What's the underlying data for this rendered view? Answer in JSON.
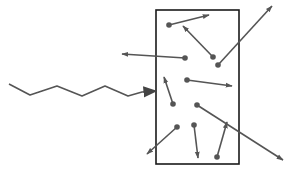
{
  "diagram": {
    "colors": {
      "stroke": "#555555",
      "box": "#1a1a1a",
      "background": "#ffffff"
    },
    "box": {
      "x": 156,
      "y": 10,
      "w": 83,
      "h": 154
    },
    "incoming_wave": {
      "points": [
        [
          9,
          84
        ],
        [
          30,
          95
        ],
        [
          57,
          86
        ],
        [
          82,
          96
        ],
        [
          105,
          86
        ],
        [
          128,
          96
        ],
        [
          142,
          92
        ]
      ],
      "tip": [
        156,
        91
      ]
    },
    "particles": [
      {
        "from": [
          169,
          25
        ],
        "to": [
          209,
          15
        ]
      },
      {
        "from": [
          213,
          57
        ],
        "to": [
          183,
          26
        ]
      },
      {
        "from": [
          218,
          65
        ],
        "to": [
          272,
          6
        ]
      },
      {
        "from": [
          185,
          58
        ],
        "to": [
          122,
          54
        ]
      },
      {
        "from": [
          187,
          80
        ],
        "to": [
          232,
          86
        ]
      },
      {
        "from": [
          173,
          104
        ],
        "to": [
          164,
          77
        ]
      },
      {
        "from": [
          197,
          105
        ],
        "to": [
          283,
          160
        ]
      },
      {
        "from": [
          177,
          127
        ],
        "to": [
          147,
          154
        ]
      },
      {
        "from": [
          194,
          125
        ],
        "to": [
          198,
          158
        ]
      },
      {
        "from": [
          217,
          157
        ],
        "to": [
          227,
          122
        ]
      }
    ]
  }
}
